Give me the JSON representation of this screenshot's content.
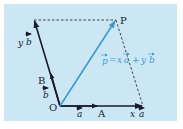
{
  "figure": {
    "background_color": "#cbe7f3",
    "axis_color": "#1a1a2e",
    "accent_color": "#3b9ad6",
    "dashed_color": "#1a1a2e"
  },
  "points": {
    "O": {
      "label": "O",
      "x": 60,
      "y": 106
    },
    "A": {
      "label": "A",
      "x": 102,
      "y": 106
    },
    "B": {
      "label": "B",
      "x": 50,
      "y": 73
    },
    "P": {
      "label": "P",
      "x": 116,
      "y": 20
    },
    "xa_end": {
      "x": 143,
      "y": 106
    },
    "yb_end": {
      "x": 34,
      "y": 20
    }
  },
  "labels": {
    "vec_a": "a",
    "vec_b": "b",
    "x_a": "x a",
    "x_a_x": "x",
    "x_a_a": "a",
    "y_b_y": "y",
    "y_b_b": "b",
    "p_eq_p": "p",
    "p_eq_eq": "=",
    "p_eq_x": "x",
    "p_eq_a": "a",
    "p_eq_plus": "+",
    "p_eq_y": "y",
    "p_eq_b": "b",
    "equation": "p = x a + y b"
  }
}
